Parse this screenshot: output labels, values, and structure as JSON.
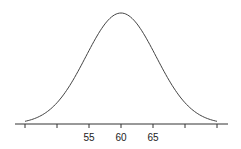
{
  "chart_data": {
    "type": "line",
    "title": "",
    "xlabel": "",
    "ylabel": "",
    "distribution": {
      "mean": 60,
      "sd": 5.5
    },
    "xlim": [
      43,
      77
    ],
    "ticks": [
      45,
      50,
      55,
      60,
      65,
      70,
      75
    ],
    "tick_labels": [
      "",
      "",
      "55",
      "60",
      "65",
      "",
      ""
    ],
    "grid": false,
    "y_axis_shown": false
  }
}
